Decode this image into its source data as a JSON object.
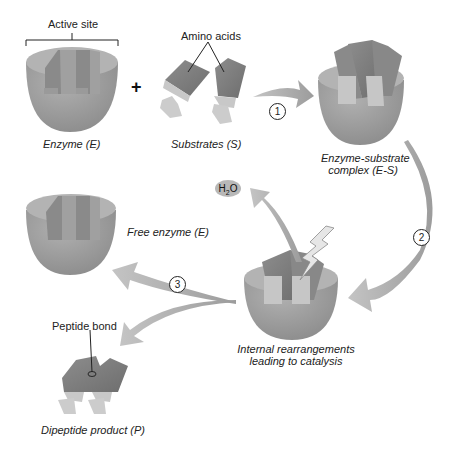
{
  "diagram": {
    "colors": {
      "enzyme_body": "#9a9a9a",
      "enzyme_top": "#b5b5b5",
      "substrate_dark": "#7d7d7d",
      "substrate_light": "#c8c8c8",
      "arrow": "#a8a8a8",
      "h2o_bubble": "#b8b8b8",
      "text": "#222222"
    },
    "labels": {
      "active_site": "Active site",
      "amino_acids": "Amino acids",
      "enzyme": "Enzyme (E)",
      "substrates": "Substrates (S)",
      "es_complex_line1": "Enzyme-substrate",
      "es_complex_line2": "complex (E-S)",
      "free_enzyme": "Free enzyme (E)",
      "internal_line1": "Internal rearrangements",
      "internal_line2": "leading to catalysis",
      "peptide_bond": "Peptide bond",
      "dipeptide": "Dipeptide product (P)",
      "plus": "+",
      "h2o_h": "H",
      "h2o_sub": "2",
      "h2o_o": "O"
    },
    "steps": [
      {
        "number": "1",
        "glyph": "①",
        "from": "Substrates (S)",
        "to": "Enzyme-substrate complex (E-S)"
      },
      {
        "number": "2",
        "glyph": "②",
        "from": "Enzyme-substrate complex (E-S)",
        "to": "Internal rearrangements leading to catalysis"
      },
      {
        "number": "3",
        "glyph": "③",
        "from": "Internal rearrangements leading to catalysis",
        "to": "Free enzyme (E) + Dipeptide product (P)"
      }
    ],
    "nodes": [
      {
        "id": "enzyme",
        "label": "Enzyme (E)"
      },
      {
        "id": "substrates",
        "label": "Substrates (S)"
      },
      {
        "id": "es_complex",
        "label": "Enzyme-substrate complex (E-S)"
      },
      {
        "id": "catalysis",
        "label": "Internal rearrangements leading to catalysis"
      },
      {
        "id": "free_enzyme",
        "label": "Free enzyme (E)"
      },
      {
        "id": "product",
        "label": "Dipeptide product (P)"
      },
      {
        "id": "water",
        "label": "H2O"
      }
    ]
  }
}
